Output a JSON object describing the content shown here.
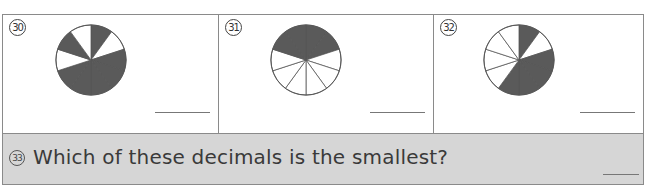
{
  "worksheet": {
    "instruction_context": "Fractions shown by shaded pie charts; write the decimal",
    "questions": [
      {
        "number": "30",
        "label": "⑳",
        "pie": {
          "slices": 10,
          "shaded": [
            0,
            2,
            3,
            4,
            5,
            6,
            8
          ],
          "shaded_count": 7
        },
        "answer": ""
      },
      {
        "number": "31",
        "label": "㉛",
        "pie": {
          "slices": 10,
          "shaded": [
            0,
            1,
            8,
            9
          ],
          "shaded_count": 4
        },
        "answer": ""
      },
      {
        "number": "32",
        "label": "㉜",
        "pie": {
          "slices": 10,
          "shaded": [
            0,
            2,
            3,
            4,
            5
          ],
          "shaded_count": 5
        },
        "answer": ""
      }
    ],
    "q33": {
      "number": "33",
      "text": "Which of these decimals is the smallest?",
      "answer": ""
    },
    "colors": {
      "shaded": "#5a5a5a",
      "unshaded": "#ffffff",
      "border": "#8a8a8a",
      "bottom_row_bg": "#d6d6d6"
    }
  }
}
